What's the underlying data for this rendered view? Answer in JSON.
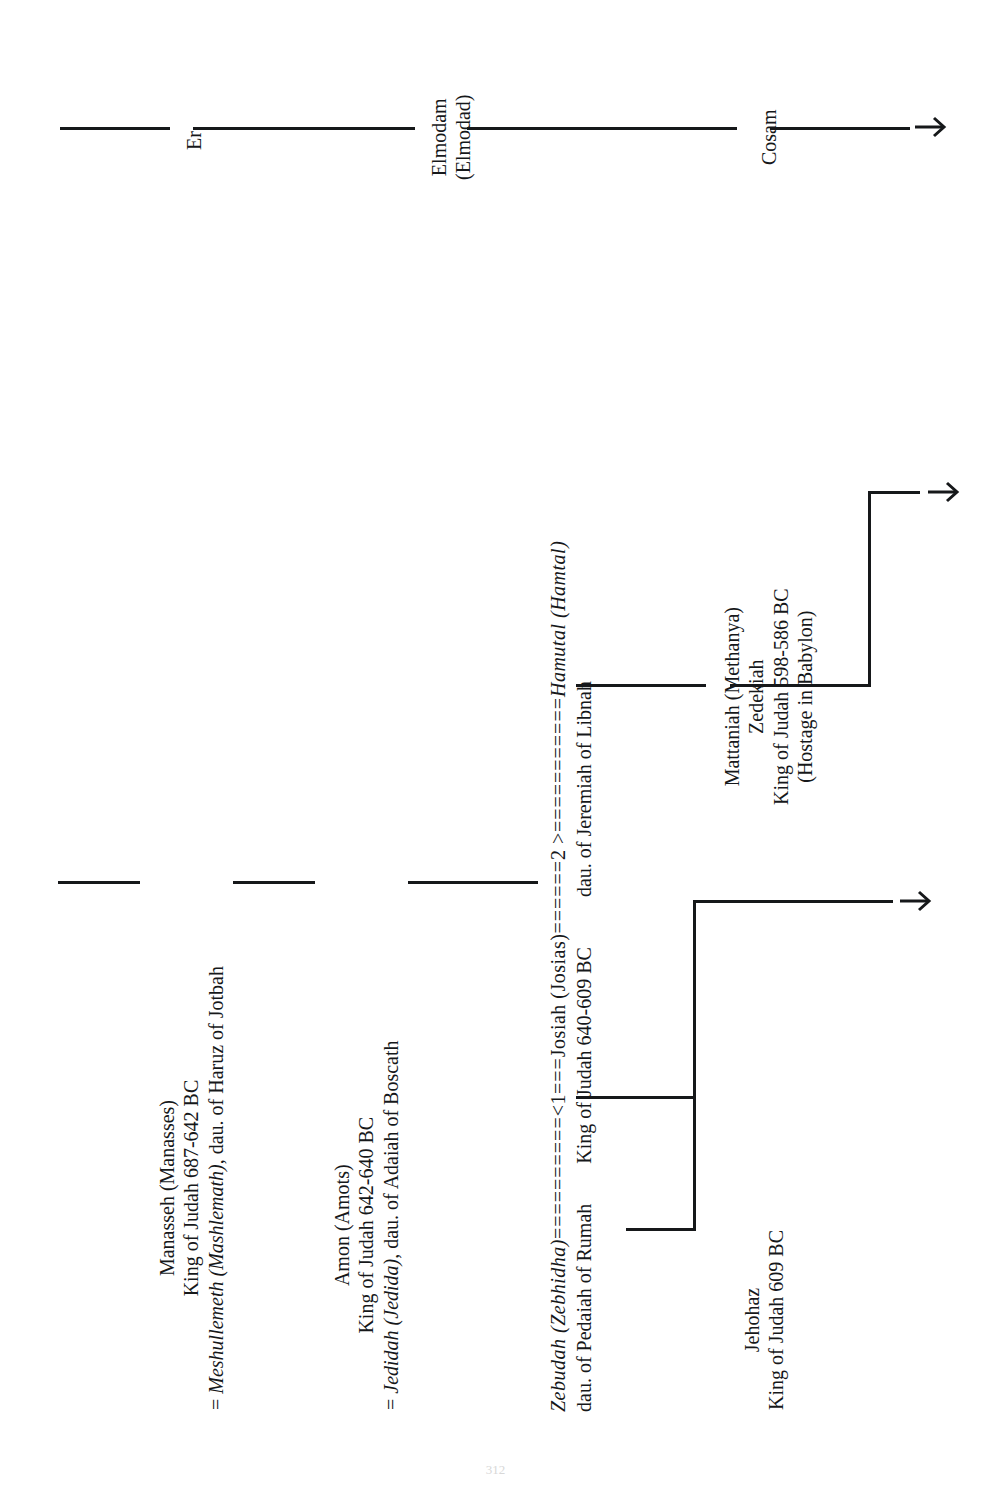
{
  "document": {
    "type": "genealogy-chart",
    "orientation": "rotated-90-counterclockwise",
    "page_number": "312",
    "line_color": "#16181a",
    "background_color": "#ffffff"
  },
  "ancestor_line": {
    "label": "upper-descent-line",
    "nodes": [
      {
        "name": "Er",
        "alt": ""
      },
      {
        "name": "Elmodam",
        "alt": "(Elmodad)"
      },
      {
        "name": "Cosam",
        "alt": ""
      }
    ],
    "continues": true
  },
  "main_line": {
    "manasseh": {
      "name": "Manasseh (Manasses)",
      "reign": "King of Judah 687-642 BC",
      "spouse_prefix": "= ",
      "spouse_name": "Meshullemeth (Mashlemath)",
      "spouse_rest": ", dau. of Haruz of Jotbah"
    },
    "amon": {
      "name": "Amon (Amots)",
      "reign": "King of Judah 642-640 BC",
      "spouse_prefix": "= ",
      "spouse_name": "Jedidah (Jedida)",
      "spouse_rest": ", dau. of Adaiah of Boscath"
    },
    "josiah": {
      "name": "Josiah (Josias)",
      "reign": "King of Judah 640-609 BC",
      "marriage_1_marker": "<1",
      "marriage_2_marker": "2 >",
      "marriage_rule": "==========="
    }
  },
  "wives": {
    "first": {
      "order_marker": "<1",
      "name": "Zebudah (Zebhidha)",
      "name_italic": "Zebudah (Zebhidha)",
      "descriptor": "dau. of Pedaiah of Rumah",
      "rule": "=========="
    },
    "second": {
      "order_marker": "2 >",
      "name": "Hamutal (Hamtal)",
      "name_italic": "Hamutal (Hamtal)",
      "descriptor": "dau. of Jeremiah of Libnah",
      "rule": "============"
    }
  },
  "children": {
    "jehohaz": {
      "name": "Jehohaz",
      "reign": "King of Judah 609 BC"
    },
    "zedekiah": {
      "name": "Mattaniah (Methanya)",
      "throne_name": "Zedekiah",
      "reign": "King of Judah 598-586 BC",
      "note": "(Hostage in Babylon)"
    }
  },
  "continuation_arrows": [
    {
      "name": "ancestor-line-continues",
      "label": ""
    },
    {
      "name": "first-marriage-issue-continues",
      "label": ""
    },
    {
      "name": "second-marriage-issue-continues",
      "label": ""
    }
  ]
}
